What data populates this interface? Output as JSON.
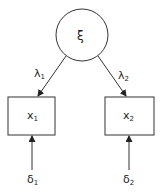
{
  "diagram": {
    "type": "measurement-model",
    "latent": {
      "symbol": "ξ"
    },
    "loadings": [
      {
        "symbol": "λ",
        "sub": "1"
      },
      {
        "symbol": "λ",
        "sub": "2"
      }
    ],
    "indicators": [
      {
        "symbol": "x",
        "sub": "1"
      },
      {
        "symbol": "x",
        "sub": "2"
      }
    ],
    "errors": [
      {
        "symbol": "δ",
        "sub": "1"
      },
      {
        "symbol": "δ",
        "sub": "2"
      }
    ],
    "colors": {
      "stroke": "#333333",
      "background": "#ffffff"
    }
  }
}
